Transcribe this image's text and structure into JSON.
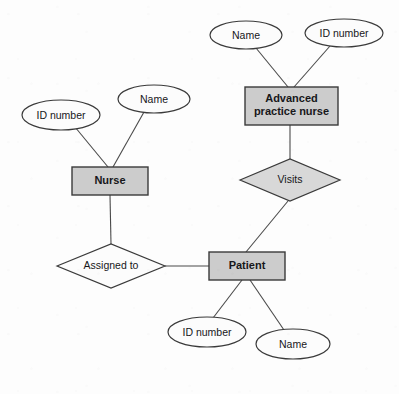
{
  "diagram": {
    "type": "entity-relationship-diagram",
    "background_color": "#fdfdfd",
    "entity_fill": "#cccccc",
    "relationship_fill": "#d8d8d8",
    "attribute_fill": "#fcfcfc",
    "line_color": "#4a4a4a"
  },
  "entities": [
    {
      "id": "nurse",
      "label": "Nurse",
      "shape": "rectangle",
      "x": 72,
      "y": 167,
      "w": 76,
      "h": 28
    },
    {
      "id": "advanced_practice_nurse",
      "label": "Advanced\npractice nurse",
      "shape": "rectangle",
      "x": 245,
      "y": 87,
      "w": 93,
      "h": 38
    },
    {
      "id": "patient",
      "label": "Patient",
      "shape": "rectangle",
      "x": 209,
      "y": 252,
      "w": 76,
      "h": 28
    }
  ],
  "relationships": [
    {
      "id": "assigned_to",
      "label": "Assigned to",
      "shape": "diamond",
      "filled": false,
      "cx": 111,
      "cy": 266,
      "rx": 54,
      "ry": 22,
      "connects": [
        "nurse",
        "patient"
      ]
    },
    {
      "id": "visits",
      "label": "Visits",
      "shape": "diamond",
      "filled": true,
      "cx": 290,
      "cy": 180,
      "rx": 50,
      "ry": 21,
      "connects": [
        "advanced_practice_nurse",
        "patient"
      ]
    }
  ],
  "attributes": [
    {
      "id": "nurse_id_number",
      "label": "ID number",
      "shape": "ellipse",
      "cx": 61,
      "cy": 115,
      "rx": 39,
      "ry": 15,
      "belongs_to": "nurse"
    },
    {
      "id": "nurse_name",
      "label": "Name",
      "shape": "ellipse",
      "cx": 154,
      "cy": 99,
      "rx": 36,
      "ry": 14,
      "belongs_to": "nurse"
    },
    {
      "id": "apn_name",
      "label": "Name",
      "shape": "ellipse",
      "cx": 246,
      "cy": 35,
      "rx": 36,
      "ry": 14,
      "belongs_to": "advanced_practice_nurse"
    },
    {
      "id": "apn_id_number",
      "label": "ID number",
      "shape": "ellipse",
      "cx": 344,
      "cy": 33,
      "rx": 39,
      "ry": 14,
      "belongs_to": "advanced_practice_nurse"
    },
    {
      "id": "patient_id_number",
      "label": "ID number",
      "shape": "ellipse",
      "cx": 207,
      "cy": 332,
      "rx": 39,
      "ry": 15,
      "belongs_to": "patient"
    },
    {
      "id": "patient_name",
      "label": "Name",
      "shape": "ellipse",
      "cx": 293,
      "cy": 344,
      "rx": 37,
      "ry": 15,
      "belongs_to": "patient"
    }
  ],
  "connectors": [
    {
      "id": "nurse-id-number-link",
      "from": "nurse_id_number",
      "to": "nurse"
    },
    {
      "id": "nurse-name-link",
      "from": "nurse_name",
      "to": "nurse"
    },
    {
      "id": "nurse-assigned-link",
      "from": "nurse",
      "to": "assigned_to"
    },
    {
      "id": "assigned-patient-link",
      "from": "assigned_to",
      "to": "patient"
    },
    {
      "id": "apn-name-link",
      "from": "apn_name",
      "to": "advanced_practice_nurse"
    },
    {
      "id": "apn-id-number-link",
      "from": "apn_id_number",
      "to": "advanced_practice_nurse"
    },
    {
      "id": "apn-visits-link",
      "from": "advanced_practice_nurse",
      "to": "visits"
    },
    {
      "id": "visits-patient-link",
      "from": "visits",
      "to": "patient"
    },
    {
      "id": "patient-id-number-link",
      "from": "patient",
      "to": "patient_id_number"
    },
    {
      "id": "patient-name-link",
      "from": "patient",
      "to": "patient_name"
    }
  ]
}
